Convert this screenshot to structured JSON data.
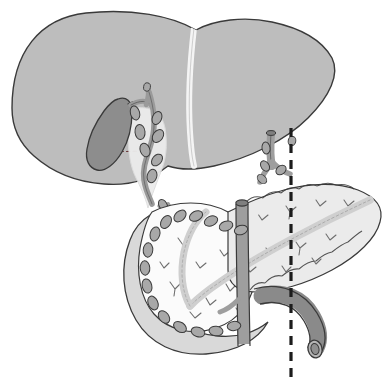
{
  "figure": {
    "background_color": "#ffffff",
    "width": 392,
    "height": 387
  },
  "palette": {
    "outline": "#3a3a3a",
    "liver_fill": "#bdbdbd",
    "liver_highlight": "#f2f2f2",
    "gallbladder_fill": "#8d8d8d",
    "duct_fill": "#9a9a9a",
    "duct_sheath": "#ececec",
    "lymph_node_fill": "#a8a8a8",
    "duodenum_fill": "#d9d9d9",
    "pancreas_fill": "#ebebeb",
    "pancreas_head_fill": "#fbfbfb",
    "vessel_fill": "#9e9e9e",
    "vessel_dark": "#8a8a8a",
    "pancreatic_duct_fill": "#cfcfcf",
    "dashed_line": "#1c1c1c"
  },
  "structures": [
    {
      "id": "liver",
      "name": "liver",
      "label": "Liver",
      "fill": "#bdbdbd",
      "note": "Large upper organ spanning left and right lobes"
    },
    {
      "id": "falciform-ligament",
      "name": "falciform-ligament",
      "label": "Falciform ligament",
      "fill": "#f2f2f2",
      "note": "Pale vertical band dividing left and right hepatic lobes"
    },
    {
      "id": "gallbladder",
      "name": "gallbladder",
      "label": "Gallbladder",
      "fill": "#8d8d8d",
      "note": "Dark pear-shaped organ on inferior liver surface"
    },
    {
      "id": "cystic-duct",
      "name": "cystic-duct",
      "label": "Cystic duct",
      "fill": "#9a9a9a"
    },
    {
      "id": "common-bile-duct",
      "name": "common-bile-duct",
      "label": "Common bile duct",
      "fill": "#9a9a9a",
      "note": "Descends from porta hepatis toward pancreatic head"
    },
    {
      "id": "hepatoduodenal-ligament",
      "name": "hepatoduodenal-ligament",
      "label": "Hepatoduodenal ligament",
      "fill": "#ececec"
    },
    {
      "id": "duodenum",
      "name": "duodenum",
      "label": "Duodenum (C-loop)",
      "fill": "#d9d9d9"
    },
    {
      "id": "pancreas-head",
      "name": "pancreas-head",
      "label": "Head of pancreas",
      "fill": "#fbfbfb"
    },
    {
      "id": "pancreas-body-tail",
      "name": "pancreas-body-tail",
      "label": "Body and tail of pancreas",
      "fill": "#ebebeb"
    },
    {
      "id": "pancreatic-duct",
      "name": "pancreatic-duct",
      "label": "Pancreatic duct",
      "fill": "#cfcfcf"
    },
    {
      "id": "superior-mesenteric-vessel",
      "name": "superior-mesenteric-vessel",
      "label": "Superior mesenteric vessels",
      "fill": "#9e9e9e",
      "note": "Vertical cut vessel passing behind pancreatic neck"
    },
    {
      "id": "splenic-vessel",
      "name": "splenic-vessel",
      "label": "Splenic vessel",
      "fill": "#8a8a8a",
      "note": "Curving vessel with cut open end, lower right"
    },
    {
      "id": "celiac-stump",
      "name": "celiac-artery-stump",
      "label": "Celiac / hepatic artery stump",
      "fill": "#9e9e9e",
      "note": "Cut vessel with branches, upper right"
    },
    {
      "id": "gastroduodenal-artery",
      "name": "gastroduodenal-artery",
      "label": "Gastroduodenal artery",
      "fill": "#9e9e9e"
    },
    {
      "id": "resection-line",
      "name": "resection-line",
      "label": "Resection line",
      "stroke": "#1c1c1c",
      "style": "dashed",
      "orientation": "vertical",
      "x": 291,
      "y_start": 128,
      "y_end": 380
    },
    {
      "id": "liver-bed-line",
      "name": "liver-bed-dashed-line",
      "label": "Hidden contour",
      "stroke": "#6b3a3a",
      "style": "dashed",
      "orientation": "horizontal"
    }
  ],
  "lymph_nodes": {
    "name": "lymph-nodes",
    "label": "Lymph nodes",
    "fill": "#a8a8a8",
    "count": 31,
    "groups": [
      {
        "group": "periductal",
        "label": "Periductal nodes",
        "count": 7
      },
      {
        "group": "peripancreatic",
        "label": "Peripancreatic nodes",
        "count": 16
      },
      {
        "group": "celiac",
        "label": "Celiac nodes",
        "count": 5
      },
      {
        "group": "mesenteric",
        "label": "Mesenteric nodes",
        "count": 3
      }
    ]
  }
}
